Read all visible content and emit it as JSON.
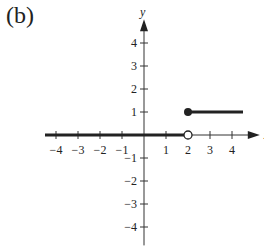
{
  "panel_label": "(b)",
  "chart_data": {
    "type": "line",
    "title": "",
    "panel": "(b)",
    "xlabel": "x",
    "ylabel": "y",
    "xlim": [
      -4.5,
      4.8
    ],
    "ylim": [
      -4.5,
      4.8
    ],
    "x_ticks": [
      -4,
      -3,
      -2,
      -1,
      1,
      2,
      3,
      4
    ],
    "y_ticks": [
      -4,
      -3,
      -2,
      -1,
      1,
      2,
      3,
      4
    ],
    "grid": false,
    "series": [
      {
        "name": "segment y=0",
        "x": [
          -4.5,
          2
        ],
        "y": [
          0,
          0
        ],
        "endpoints": {
          "right": "open"
        }
      },
      {
        "name": "segment y=1",
        "x": [
          2,
          4.5
        ],
        "y": [
          1,
          1
        ],
        "endpoints": {
          "left": "closed"
        }
      }
    ],
    "annotations": [
      "open circle at (2,0)",
      "closed dot at (2,1)"
    ]
  }
}
